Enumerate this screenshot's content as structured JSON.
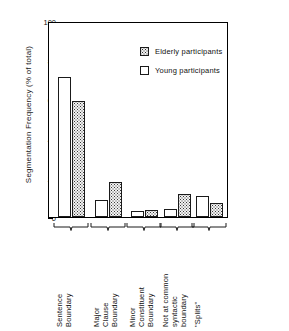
{
  "chart_data": {
    "type": "bar",
    "title": "",
    "subtitle": "",
    "xlabel": "",
    "ylabel": "Segmentation Frequency (% of total)",
    "ylim": [
      0,
      100
    ],
    "ytick_labels": [
      "0",
      "20",
      "40",
      "60",
      "80",
      "100"
    ],
    "ytick_values": [
      0,
      20,
      40,
      60,
      80,
      100
    ],
    "minor_tick_values": [
      10,
      30,
      50,
      70,
      90
    ],
    "grid": false,
    "legend_position": "upper right inside",
    "categories": [
      "Sentence Boundary",
      "Major Clause Boundary",
      "Minor Constituent Boundary",
      "Not at common syntactic boundary",
      "\"Splits\""
    ],
    "category_label_lines": [
      [
        "Sentence",
        "Boundary"
      ],
      [
        "Major",
        "Clause",
        "Boundary"
      ],
      [
        "Minor",
        "Constituent",
        "Boundary"
      ],
      [
        "Not at common",
        "syntactic",
        "boundary"
      ],
      [
        "\"Splits\""
      ]
    ],
    "series": [
      {
        "name": "Young participants",
        "fill": "white",
        "values": [
          72,
          9,
          3,
          4,
          11
        ]
      },
      {
        "name": "Elderly participants",
        "fill": "stippled",
        "values": [
          60,
          18,
          3.5,
          12,
          7
        ]
      }
    ]
  },
  "legend": {
    "entries": [
      {
        "label": "Elderly participants",
        "swatch": "stippled"
      },
      {
        "label": "Young participants",
        "swatch": "white"
      }
    ]
  },
  "axis": {
    "y_title": "Segmentation Frequency (% of total)",
    "y_ticks": [
      "100",
      "80",
      "60",
      "40",
      "20",
      "0"
    ]
  },
  "colors": {
    "axis": "#000000",
    "bar_outline": "#1a1a1a",
    "young_fill": "#ffffff",
    "elderly_fill": "#f0f0f0",
    "elderly_dots": "#333333",
    "background": "#ffffff",
    "text": "#111111"
  }
}
